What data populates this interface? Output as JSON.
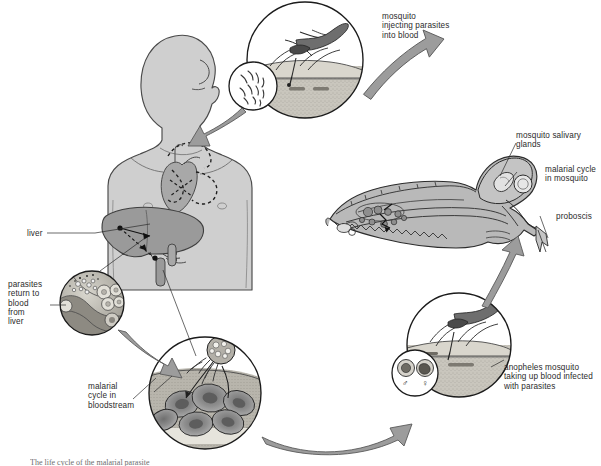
{
  "figure": {
    "caption": "The life cycle of the malarial parasite",
    "palette": {
      "body_fill": "#cfcfcf",
      "body_stroke": "#4a4a4a",
      "liver_fill": "#9a9a9a",
      "organ_fill": "#a8a8a8",
      "arrow_fill": "#9c9c9c",
      "arrow_stroke": "#5a5a5a",
      "skin_fill": "#c9c6bd",
      "blood_fill": "#b4b1a8",
      "circle_stroke": "#1b1b1b",
      "text": "#2b2b2b",
      "mosquito_fill": "#b9b9b9"
    }
  },
  "labels": {
    "mosquito_injecting": "mosquito\ninjecting parasites\ninto blood",
    "salivary_glands": "mosquito salivary\nglands",
    "malarial_cycle_mosquito": "malarial cycle\nin mosquito",
    "proboscis": "proboscis",
    "anopheles_taking_blood": "anopheles mosquito\ntaking up blood infected\nwith parasites",
    "malarial_cycle_blood": "malarial\ncycle in\nbloodstream",
    "parasites_return": "parasites\nreturn to\nblood\nfrom\nliver",
    "liver": "liver"
  },
  "stages": [
    {
      "id": "inject",
      "name": "mosquito injecting parasites into blood",
      "inset": "sporozoites in saliva"
    },
    {
      "id": "liver",
      "name": "parasites return to blood from liver",
      "inset": "infected liver cells releasing merozoites"
    },
    {
      "id": "bloodstream",
      "name": "malarial cycle in bloodstream",
      "inset": "merozoites invading red blood cells"
    },
    {
      "id": "uptake",
      "name": "anopheles mosquito taking up blood infected with parasites",
      "inset": "male and female gametocytes"
    },
    {
      "id": "mosquito",
      "name": "malarial cycle in mosquito",
      "inset": "mosquito internal anatomy with oocysts and salivary glands"
    }
  ],
  "gametocyte_symbols": {
    "male": "♂",
    "female": "♀"
  }
}
